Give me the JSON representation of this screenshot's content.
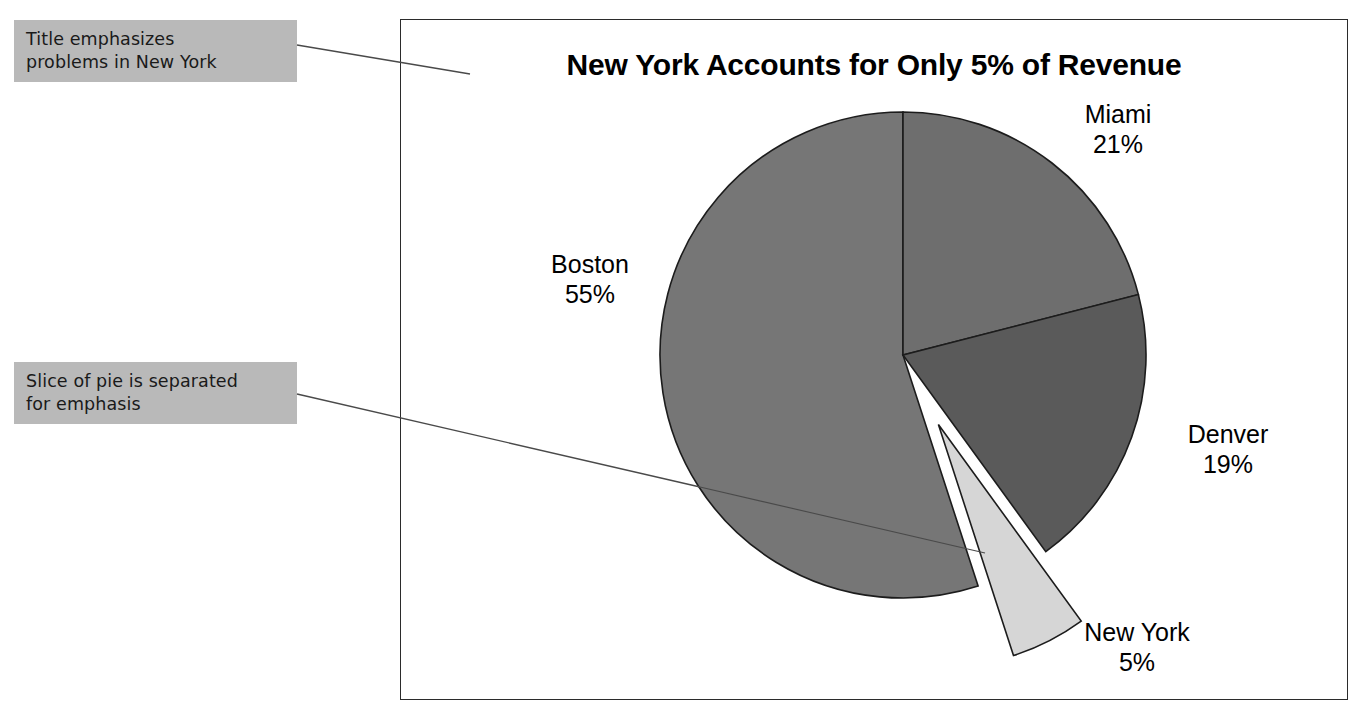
{
  "chart_data": {
    "type": "pie",
    "title": "New York Accounts for Only 5% of Revenue",
    "xlabel": "",
    "ylabel": "",
    "unit": "%",
    "legend": "none",
    "grid": false,
    "categories": [
      "Miami",
      "Denver",
      "New York",
      "Boston"
    ],
    "values": [
      21,
      19,
      5,
      55
    ],
    "labels": [
      "Miami 21%",
      "Denver 19%",
      "New York 5%",
      "Boston 55%"
    ],
    "exploded_slice": "New York",
    "start_angle_deg": 0,
    "direction": "clockwise",
    "slices": [
      {
        "name": "Miami",
        "label": "Miami",
        "percent_text": "21%",
        "value": 21,
        "color": "#6e6e6e",
        "exploded": false,
        "label_position": "top-right"
      },
      {
        "name": "Denver",
        "label": "Denver",
        "percent_text": "19%",
        "value": 19,
        "color": "#5a5a5a",
        "exploded": false,
        "label_position": "right"
      },
      {
        "name": "New York",
        "label": "New York",
        "percent_text": "5%",
        "value": 5,
        "color": "#d6d6d6",
        "exploded": true,
        "label_position": "bottom-right"
      },
      {
        "name": "Boston",
        "label": "Boston",
        "percent_text": "55%",
        "value": 55,
        "color": "#767676",
        "exploded": false,
        "label_position": "left"
      }
    ]
  },
  "annotations": [
    {
      "id": "title-note",
      "line1": "Title emphasizes",
      "line2": "problems in New York",
      "background": "#b9b9b9",
      "points_to": "chart-title"
    },
    {
      "id": "slice-note",
      "line1": "Slice of pie is separated",
      "line2": "for emphasis",
      "background": "#b9b9b9",
      "points_to": "new-york-slice"
    }
  ],
  "frame": {
    "border_color": "#2b2b2b",
    "background": "#ffffff"
  }
}
